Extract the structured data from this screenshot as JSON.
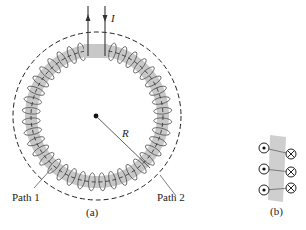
{
  "figure": {
    "panel_a": {
      "current_label": "I",
      "radius_label": "R",
      "path1_label": "Path 1",
      "path2_label": "Path 2",
      "caption": "(a)",
      "winding_count": 40
    },
    "panel_b": {
      "caption": "(b)",
      "rows": [
        {
          "left": "dot",
          "right": "cross"
        },
        {
          "left": "dot",
          "right": "cross"
        },
        {
          "left": "dot",
          "right": "cross"
        }
      ]
    },
    "colors": {
      "core_fill": "#c8c8c8",
      "wire": "#555555",
      "line": "#222222"
    }
  }
}
